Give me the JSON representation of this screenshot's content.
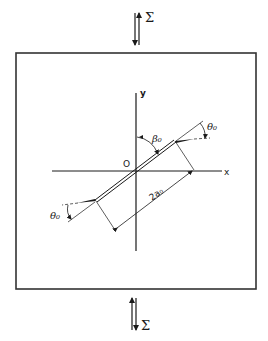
{
  "diagram": {
    "type": "inclined kinked crack under uniaxial stress",
    "load": {
      "top_label": "Σ",
      "bottom_label": "Σ"
    },
    "axes": {
      "x_label": "x",
      "y_label": "y",
      "origin_label": "O"
    },
    "crack": {
      "length_label": "2a₀",
      "inclination_label": "β₀",
      "kink_angle_label_upper": "θ₀",
      "kink_angle_label_lower": "θ₀"
    },
    "colors": {
      "line": "#1a1a1a",
      "background": "#ffffff"
    }
  }
}
